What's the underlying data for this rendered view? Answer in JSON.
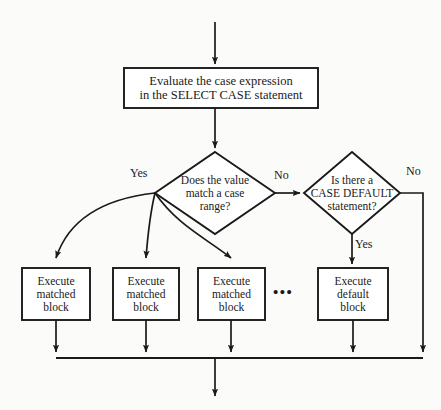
{
  "diagram": {
    "background_color": "#fbfbf9",
    "line_color": "#1a1a1a",
    "box_fill": "#ffffff",
    "nodes": {
      "process": {
        "label": "Evaluate the case expression\nin the SELECT CASE statement",
        "shape": "rectangle"
      },
      "decision_match": {
        "label": "Does the value\nmatch a case\nrange?",
        "shape": "diamond"
      },
      "decision_default": {
        "label": "Is there a\nCASE DEFAULT\nstatement?",
        "shape": "diamond"
      },
      "matched_block_1": {
        "label": "Execute\nmatched\nblock",
        "shape": "rectangle"
      },
      "matched_block_2": {
        "label": "Execute\nmatched\nblock",
        "shape": "rectangle"
      },
      "matched_block_3": {
        "label": "Execute\nmatched\nblock",
        "shape": "rectangle"
      },
      "default_block": {
        "label": "Execute\ndefault\nblock",
        "shape": "rectangle"
      },
      "ellipsis": {
        "label": "•••"
      }
    },
    "edge_labels": {
      "match_yes": "Yes",
      "match_no": "No",
      "default_yes": "Yes",
      "default_no": "No"
    }
  }
}
